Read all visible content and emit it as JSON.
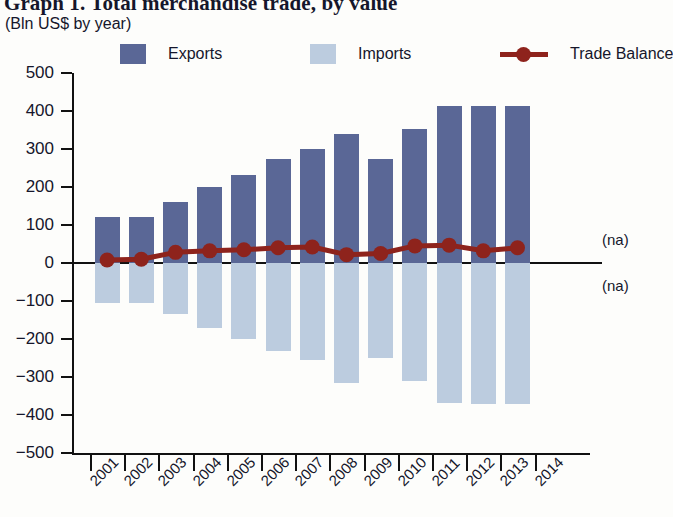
{
  "header": {
    "title": "Graph 1. Total merchandise trade, by value",
    "subtitle": "(Bln US$ by year)"
  },
  "legend": [
    {
      "label": "Exports",
      "color": "#5a6796",
      "marker": "square"
    },
    {
      "label": "Imports",
      "color": "#bcccdf",
      "marker": "square"
    },
    {
      "label": "Trade Balance",
      "color": "#8e231c",
      "marker": "line-dot"
    }
  ],
  "annotations": [
    {
      "text": "(na)",
      "position": "above-zero-right"
    },
    {
      "text": "(na)",
      "position": "below-zero-right"
    }
  ],
  "chart_data": {
    "type": "bar",
    "title": "Graph 1. Total merchandise trade, by value",
    "subtitle": "(Bln US$ by year)",
    "xlabel": "",
    "ylabel": "",
    "unit": "Bln US$",
    "ylim": [
      -500,
      500
    ],
    "ytick_step": 100,
    "yticks": [
      500,
      400,
      300,
      200,
      100,
      0,
      -100,
      -200,
      -300,
      -400,
      -500
    ],
    "ytick_labels": [
      "500",
      "400",
      "300",
      "200",
      "100",
      "0",
      "−100",
      "−200",
      "−300",
      "−400",
      "−500"
    ],
    "xticks": [
      "2001",
      "2002",
      "2003",
      "2004",
      "2005",
      "2006",
      "2007",
      "2008",
      "2009",
      "2010",
      "2011",
      "2012",
      "2013",
      "2014"
    ],
    "categories": [
      "2001",
      "2002",
      "2003",
      "2004",
      "2005",
      "2006",
      "2007",
      "2008",
      "2009",
      "2010",
      "2011",
      "2012",
      "2013"
    ],
    "grid": false,
    "legend_position": "top",
    "series": [
      {
        "name": "Exports",
        "type": "bar",
        "color": "#5a6796",
        "values": [
          120,
          122,
          160,
          200,
          232,
          273,
          300,
          340,
          273,
          352,
          412,
          412,
          413
        ]
      },
      {
        "name": "Imports",
        "type": "bar",
        "color": "#bcccdf",
        "note": "plotted as negative values",
        "values": [
          -105,
          -105,
          -135,
          -170,
          -200,
          -232,
          -255,
          -315,
          -250,
          -310,
          -368,
          -370,
          -372
        ]
      },
      {
        "name": "Trade Balance",
        "type": "line",
        "color": "#8e231c",
        "values": [
          8,
          10,
          28,
          32,
          35,
          40,
          42,
          22,
          25,
          45,
          47,
          32,
          40
        ]
      }
    ]
  }
}
